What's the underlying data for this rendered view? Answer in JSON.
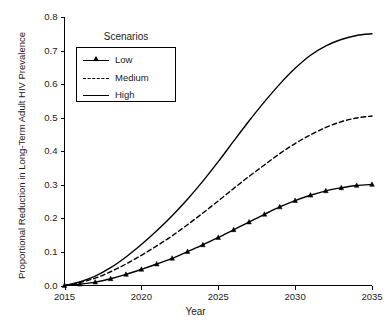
{
  "chart_data": {
    "type": "line",
    "title": "",
    "xlabel": "Year",
    "ylabel": "Proportional Reduction in Long-Term Adult HIV Prevalence",
    "xlim": [
      2015,
      2035
    ],
    "ylim": [
      0.0,
      0.8
    ],
    "grid": false,
    "legend_position": "upper-left-inside",
    "legend_title": "Scenarios",
    "xticks": [
      "2015",
      "2020",
      "2025",
      "2030",
      "2035"
    ],
    "xtick_values": [
      2015,
      2020,
      2025,
      2030,
      2035
    ],
    "yticks": [
      "0.0",
      "0.1",
      "0.2",
      "0.3",
      "0.4",
      "0.5",
      "0.6",
      "0.7",
      "0.8"
    ],
    "ytick_values": [
      0.0,
      0.1,
      0.2,
      0.3,
      0.4,
      0.5,
      0.6,
      0.7,
      0.8
    ],
    "x": [
      2015,
      2016,
      2017,
      2018,
      2019,
      2020,
      2021,
      2022,
      2023,
      2024,
      2025,
      2026,
      2027,
      2028,
      2029,
      2030,
      2031,
      2032,
      2033,
      2034,
      2035
    ],
    "series": [
      {
        "name": "Low",
        "style": "solid-with-markers",
        "marker": "triangle",
        "color": "#000000",
        "values": [
          0.0,
          0.004,
          0.01,
          0.02,
          0.033,
          0.048,
          0.064,
          0.081,
          0.101,
          0.121,
          0.143,
          0.166,
          0.189,
          0.212,
          0.234,
          0.253,
          0.269,
          0.282,
          0.291,
          0.298,
          0.301
        ]
      },
      {
        "name": "Medium",
        "style": "dashed",
        "marker": "none",
        "color": "#000000",
        "values": [
          0.0,
          0.009,
          0.022,
          0.041,
          0.064,
          0.09,
          0.118,
          0.148,
          0.181,
          0.216,
          0.252,
          0.289,
          0.325,
          0.359,
          0.393,
          0.423,
          0.449,
          0.471,
          0.488,
          0.499,
          0.505
        ]
      },
      {
        "name": "High",
        "style": "solid",
        "marker": "none",
        "color": "#000000",
        "values": [
          0.0,
          0.011,
          0.028,
          0.053,
          0.085,
          0.122,
          0.163,
          0.208,
          0.257,
          0.311,
          0.369,
          0.43,
          0.49,
          0.547,
          0.6,
          0.647,
          0.686,
          0.714,
          0.733,
          0.745,
          0.75
        ]
      }
    ]
  },
  "axes": {
    "x_label": "Year",
    "y_label": "Proportional Reduction in Long-Term Adult HIV Prevalence"
  },
  "legend": {
    "title": "Scenarios",
    "entries": [
      {
        "label": "Low"
      },
      {
        "label": "Medium"
      },
      {
        "label": "High"
      }
    ]
  },
  "colors": {
    "line": "#000000",
    "axis": "#000000",
    "background": "#ffffff",
    "text": "#1a1a1a"
  }
}
